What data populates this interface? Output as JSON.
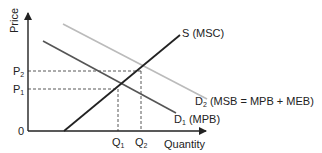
{
  "diagram": {
    "type": "supply-demand-externality",
    "axes": {
      "y_label": "Price",
      "x_label": "Quantity",
      "origin_label": "0"
    },
    "price_levels": [
      {
        "label": "P",
        "sub": "2"
      },
      {
        "label": "P",
        "sub": "1"
      }
    ],
    "quantity_levels": [
      {
        "label": "Q",
        "sub": "1"
      },
      {
        "label": "Q",
        "sub": "2"
      }
    ],
    "curves": {
      "supply": {
        "label": "S (MSC)",
        "color": "#222222"
      },
      "d1": {
        "label_main": "D",
        "label_sub": "1",
        "label_rest": " (MPB)",
        "color": "#555555"
      },
      "d2": {
        "label_main": "D",
        "label_sub": "2",
        "label_rest": " (MSB = MPB + MEB)",
        "color": "#bbbbbb"
      }
    },
    "colors": {
      "axis": "#222222",
      "dashed": "#444444"
    }
  }
}
